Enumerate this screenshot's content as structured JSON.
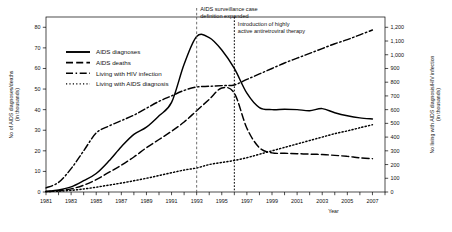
{
  "chart_data": {
    "type": "line",
    "title": "",
    "xlabel": "Year",
    "ylabel_left": "No of AIDS diagnoses/deaths (in thousands)",
    "ylabel_right": "No living with AIDS diagnosis/HIV infection (in thousands)",
    "xlim": [
      1981,
      2008
    ],
    "ylim_left": [
      0,
      85
    ],
    "ylim_right": [
      0,
      1275
    ],
    "grid": false,
    "legend_position": "upper-left-inside",
    "x_tick_labels": [
      "1981",
      "1983",
      "1985",
      "1987",
      "1989",
      "1991",
      "1993",
      "1995",
      "1997",
      "1999",
      "2001",
      "2003",
      "2005",
      "2007"
    ],
    "x_tick_values": [
      1981,
      1983,
      1985,
      1987,
      1989,
      1991,
      1993,
      1995,
      1997,
      1999,
      2001,
      2003,
      2005,
      2007
    ],
    "x_minor_ticks": [
      1982,
      1984,
      1986,
      1988,
      1990,
      1992,
      1994,
      1996,
      1998,
      2000,
      2002,
      2004,
      2006,
      2008
    ],
    "y_left_tick_labels": [
      "0",
      "10",
      "20",
      "30",
      "40",
      "50",
      "60",
      "70",
      "80"
    ],
    "y_left_tick_values": [
      0,
      10,
      20,
      30,
      40,
      50,
      60,
      70,
      80
    ],
    "y_right_tick_labels": [
      "0",
      "100",
      "200",
      "300",
      "400",
      "500",
      "600",
      "700",
      "800",
      "900",
      "1,000",
      "1,100",
      "1,200"
    ],
    "y_right_tick_values": [
      0,
      100,
      200,
      300,
      400,
      500,
      600,
      700,
      800,
      900,
      1000,
      1100,
      1200
    ],
    "x": [
      1981,
      1982,
      1983,
      1984,
      1985,
      1986,
      1987,
      1988,
      1989,
      1990,
      1991,
      1992,
      1993,
      1994,
      1995,
      1996,
      1997,
      1998,
      1999,
      2000,
      2001,
      2002,
      2003,
      2004,
      2005,
      2006,
      2007
    ],
    "series": [
      {
        "name": "AIDS diagnoses",
        "axis": "left",
        "style": "solid",
        "units": "thousands",
        "values": [
          0.3,
          1.0,
          2.5,
          5.5,
          9.0,
          15.0,
          22.0,
          28.0,
          31.5,
          37.0,
          43.5,
          62.0,
          75.5,
          75.0,
          69.0,
          60.0,
          48.0,
          41.0,
          40.0,
          40.2,
          40.0,
          39.5,
          40.5,
          38.5,
          37.0,
          36.0,
          35.5
        ]
      },
      {
        "name": "AIDS deaths",
        "axis": "left",
        "style": "dashed",
        "units": "thousands",
        "values": [
          0.2,
          0.6,
          1.5,
          3.3,
          6.0,
          9.5,
          13.0,
          17.0,
          21.5,
          25.5,
          29.5,
          34.0,
          39.5,
          45.0,
          50.5,
          48.0,
          31.0,
          21.5,
          19.0,
          18.8,
          18.6,
          18.4,
          18.2,
          17.8,
          17.3,
          16.6,
          16.2
        ]
      },
      {
        "name": "Living with HIV infection",
        "axis": "right",
        "style": "dash-dot",
        "units": "thousands",
        "values": [
          30,
          70,
          170,
          300,
          430,
          480,
          520,
          560,
          610,
          660,
          700,
          740,
          765,
          770,
          775,
          780,
          820,
          860,
          900,
          940,
          975,
          1010,
          1045,
          1080,
          1110,
          1145,
          1180
        ]
      },
      {
        "name": "Living with AIDS diagnosis",
        "axis": "right",
        "style": "dotted",
        "units": "thousands",
        "values": [
          3,
          6,
          12,
          22,
          35,
          50,
          65,
          82,
          100,
          120,
          140,
          160,
          175,
          200,
          215,
          230,
          250,
          275,
          300,
          325,
          350,
          375,
          400,
          425,
          445,
          468,
          490
        ]
      }
    ],
    "annotations": [
      {
        "name": "surveillance-case-definition",
        "text_line1": "AIDS surveillance case",
        "text_line2": "definition expanded",
        "x_value": 1993,
        "line_style": "dashed"
      },
      {
        "name": "haart-introduction",
        "text_line1": "Introduction of highly",
        "text_line2": "active antiretroviral therapy",
        "x_value": 1996,
        "line_style": "dotted"
      }
    ],
    "legend_entries": [
      {
        "label": "AIDS diagnoses",
        "style": "solid"
      },
      {
        "label": "AIDS deaths",
        "style": "dashed"
      },
      {
        "label": "Living with HIV infection",
        "style": "dash-dot"
      },
      {
        "label": "Living with AIDS diagnosis",
        "style": "dotted"
      }
    ],
    "colors": {
      "ink": "#000000",
      "annotation_line_a": "#555555",
      "annotation_line_b": "#000000"
    }
  }
}
